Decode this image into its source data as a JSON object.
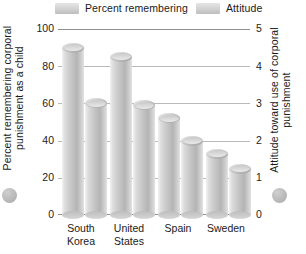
{
  "legend": {
    "items": [
      {
        "label": "Percent remembering",
        "icon": "legend-swatch-icon",
        "color": "#cfcfcf"
      },
      {
        "label": "Attitude",
        "icon": "legend-swatch-icon",
        "color": "#cfcfcf"
      }
    ]
  },
  "axes": {
    "left_title": "Percent remembering corporal punishment as a child",
    "right_title": "Attitude toward use of corporal punishment",
    "left_ticks": [
      "100",
      "80",
      "60",
      "40",
      "20",
      "0"
    ],
    "right_ticks": [
      "5",
      "4",
      "3",
      "2",
      "1",
      "0"
    ]
  },
  "decor": {
    "left_circle": "series-marker-circle",
    "right_circle": "series-marker-circle"
  },
  "chart_data": {
    "type": "bar",
    "title": "",
    "subtitle": "",
    "xlabel": "",
    "ylabel": "Percent remembering corporal punishment as a child",
    "y2label": "Attitude toward use of corporal punishment",
    "categories": [
      "South Korea",
      "United States",
      "Spain",
      "Sweden"
    ],
    "series": [
      {
        "name": "Percent remembering",
        "axis": "left",
        "values": [
          90,
          85,
          52,
          33
        ],
        "color": "#c6c6c6"
      },
      {
        "name": "Attitude",
        "axis": "right",
        "values": [
          3.0,
          2.95,
          2.0,
          1.25
        ],
        "color": "#c6c6c6"
      }
    ],
    "ylim": [
      0,
      100
    ],
    "y2lim": [
      0,
      5
    ],
    "grid": true,
    "gridlines_y": [
      0,
      20,
      40,
      60,
      80,
      100
    ],
    "legend_position": "top"
  }
}
